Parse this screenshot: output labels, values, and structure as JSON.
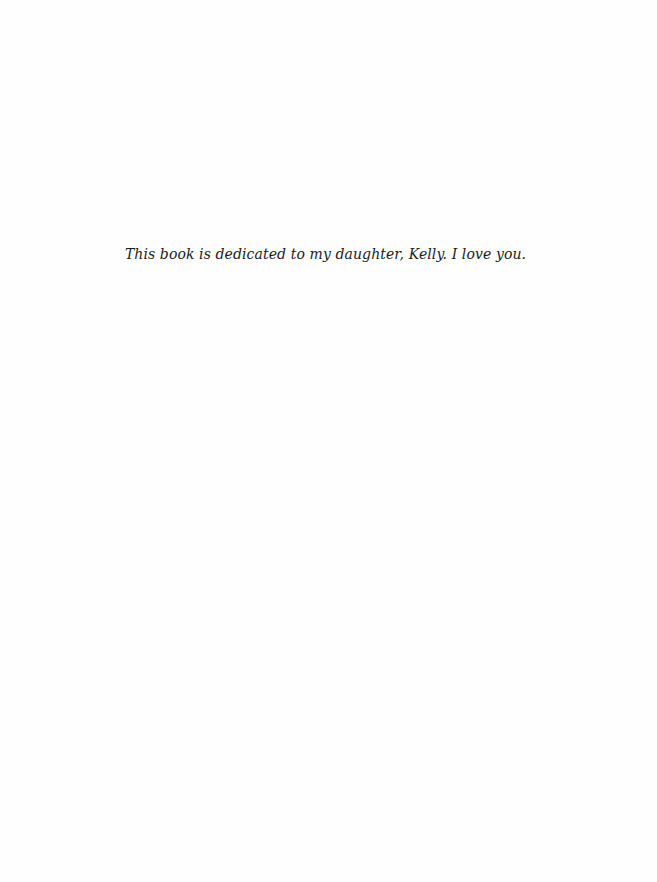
{
  "page": {
    "type": "dedication",
    "text": "This book is dedicated to my daughter, Kelly. I love you."
  },
  "colors": {
    "background": "#fefefe",
    "text": "#1a1a1a"
  }
}
